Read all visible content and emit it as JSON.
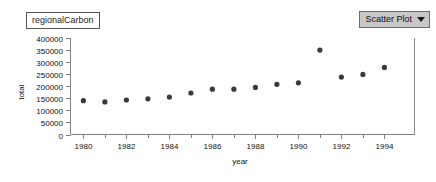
{
  "dataset": {
    "name": "regionalCarbon"
  },
  "plot_type_selector": {
    "value": "Scatter Plot",
    "caret_icon": "chevron-down-icon",
    "options": [
      "Scatter Plot"
    ]
  },
  "chart_data": {
    "type": "scatter",
    "title": "",
    "xlabel": "year",
    "ylabel": "total",
    "x": [
      1980,
      1981,
      1982,
      1983,
      1984,
      1985,
      1986,
      1987,
      1988,
      1989,
      1990,
      1991,
      1992,
      1993,
      1994
    ],
    "values": [
      140000,
      135000,
      143000,
      148000,
      155000,
      172000,
      188000,
      188000,
      195000,
      208000,
      214000,
      350000,
      238000,
      249000,
      278000
    ],
    "series": [
      {
        "name": "total",
        "values": [
          140000,
          135000,
          143000,
          148000,
          155000,
          172000,
          188000,
          188000,
          195000,
          208000,
          214000,
          350000,
          238000,
          249000,
          278000
        ]
      }
    ],
    "xlim": [
      1979.4,
      1995.4
    ],
    "ylim": [
      0,
      400000
    ],
    "ytick_labels": [
      "400000",
      "350000",
      "300000",
      "250000",
      "200000",
      "150000",
      "100000",
      "50000",
      "0"
    ],
    "ytick_values": [
      400000,
      350000,
      300000,
      250000,
      200000,
      150000,
      100000,
      50000,
      0
    ],
    "xtick_labels": [
      "1980",
      "1982",
      "1984",
      "1986",
      "1988",
      "1990",
      "1992",
      "1994"
    ],
    "xtick_values": [
      1980,
      1982,
      1984,
      1986,
      1988,
      1990,
      1992,
      1994
    ],
    "xminor_values": [
      1981,
      1983,
      1985,
      1987,
      1989,
      1991,
      1993
    ],
    "grid": false,
    "legend": "none",
    "marker": "filled-circle",
    "marker_color": "#3a3a3a"
  }
}
